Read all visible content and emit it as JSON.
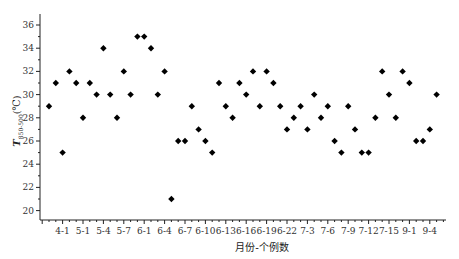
{
  "chart_data": {
    "type": "scatter",
    "title": "",
    "xlabel": "月份-个例数",
    "ylabel": "T",
    "ylabel_subscript": "850-500",
    "ylabel_unit": "(℃)",
    "ylim": [
      19,
      37
    ],
    "yticks": [
      20,
      22,
      24,
      26,
      28,
      30,
      32,
      34,
      36
    ],
    "grid": false,
    "legend": null,
    "marker": "diamond",
    "marker_color": "#000000",
    "x_tick_labels": [
      {
        "index": 3,
        "label": "4-1"
      },
      {
        "index": 6,
        "label": "5-1"
      },
      {
        "index": 9,
        "label": "5-4"
      },
      {
        "index": 12,
        "label": "5-7"
      },
      {
        "index": 15,
        "label": "6-1"
      },
      {
        "index": 18,
        "label": "6-4"
      },
      {
        "index": 21,
        "label": "6-7"
      },
      {
        "index": 24,
        "label": "6-10"
      },
      {
        "index": 27,
        "label": "6-13"
      },
      {
        "index": 30,
        "label": "6-16"
      },
      {
        "index": 33,
        "label": "6-19"
      },
      {
        "index": 36,
        "label": "6-22"
      },
      {
        "index": 39,
        "label": "7-3"
      },
      {
        "index": 42,
        "label": "7-6"
      },
      {
        "index": 45,
        "label": "7-9"
      },
      {
        "index": 48,
        "label": "7-12"
      },
      {
        "index": 51,
        "label": "7-15"
      },
      {
        "index": 54,
        "label": "9-1"
      },
      {
        "index": 57,
        "label": "9-4"
      }
    ],
    "x": [
      1,
      2,
      3,
      4,
      5,
      6,
      7,
      8,
      9,
      10,
      11,
      12,
      13,
      14,
      15,
      16,
      17,
      18,
      19,
      20,
      21,
      22,
      23,
      24,
      25,
      26,
      27,
      28,
      29,
      30,
      31,
      32,
      33,
      34,
      35,
      36,
      37,
      38,
      39,
      40,
      41,
      42,
      43,
      44,
      45,
      46,
      47,
      48,
      49,
      50,
      51,
      52,
      53,
      54,
      55,
      56,
      57,
      58
    ],
    "values": [
      29,
      31,
      25,
      32,
      31,
      28,
      31,
      30,
      34,
      30,
      28,
      32,
      30,
      35,
      35,
      34,
      30,
      32,
      21,
      26,
      26,
      29,
      27,
      26,
      25,
      31,
      29,
      28,
      31,
      30,
      32,
      29,
      32,
      31,
      29,
      27,
      28,
      29,
      27,
      30,
      28,
      29,
      26,
      25,
      29,
      27,
      25,
      25,
      28,
      32,
      30,
      28,
      32,
      31,
      26,
      26,
      27,
      30
    ]
  }
}
